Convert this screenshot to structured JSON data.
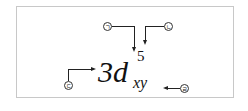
{
  "diagram": {
    "notation": {
      "coefficient": "3",
      "orbital": "d",
      "superscript": "5",
      "subscript": "xy",
      "full": "3d5xy"
    },
    "labels": [
      {
        "id": "a",
        "text": "ㄱ",
        "points_to": "orbital d (upper)"
      },
      {
        "id": "b",
        "text": "ㄴ",
        "points_to": "superscript 5"
      },
      {
        "id": "c",
        "text": "ㄷ",
        "points_to": "coefficient 3"
      },
      {
        "id": "d",
        "text": "ㄹ",
        "points_to": "subscript xy"
      }
    ],
    "colors": {
      "ink": "#222222",
      "border": "#c8c8c8",
      "background": "#ffffff"
    }
  }
}
